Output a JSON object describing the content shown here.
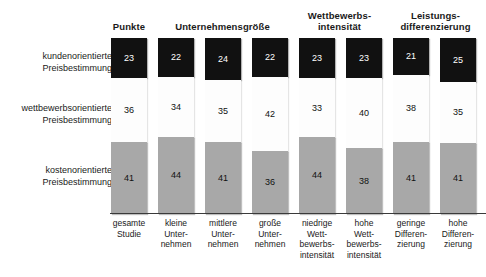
{
  "chart_data": {
    "type": "bar",
    "title": "",
    "subtitle": "",
    "xlabel": "",
    "ylabel": "",
    "stacked": true,
    "orientation": "vertical",
    "grid": false,
    "legend_position": "left-row-labels",
    "axis_baseline_visible": true,
    "ylim": [
      0,
      100
    ],
    "group_headers": [
      {
        "label": "Punkte",
        "spans": [
          0
        ]
      },
      {
        "label": "Unternehmensgröße",
        "spans": [
          1,
          2,
          3
        ]
      },
      {
        "label": "Wettbewerbs-\nintensität",
        "line1": "Wettbewerbs-",
        "line2": "intensität",
        "spans": [
          4,
          5
        ]
      },
      {
        "label": "Leistungs-\ndifferenzierung",
        "line1": "Leistungs-",
        "line2": "differenzierung",
        "spans": [
          6,
          7
        ]
      }
    ],
    "categories": [
      {
        "lines": [
          "gesamte",
          "Studie"
        ]
      },
      {
        "lines": [
          "kleine",
          "Unter-",
          "nehmen"
        ]
      },
      {
        "lines": [
          "mittlere",
          "Unter-",
          "nehmen"
        ]
      },
      {
        "lines": [
          "große",
          "Unter-",
          "nehmen"
        ]
      },
      {
        "lines": [
          "niedrige",
          "Wett-",
          "bewerbs-",
          "intensität"
        ]
      },
      {
        "lines": [
          "hohe",
          "Wett-",
          "bewerbs-",
          "intensität"
        ]
      },
      {
        "lines": [
          "geringe",
          "Differen-",
          "zierung"
        ]
      },
      {
        "lines": [
          "hohe",
          "Differen-",
          "zierung"
        ]
      }
    ],
    "series": [
      {
        "name": "kundenorientierte Preisbestimmung",
        "label_line1": "kundenorientierte",
        "label_line2": "Preisbestimmung",
        "color": "#111111",
        "value_text_color": "#ffffff",
        "values": [
          23,
          22,
          24,
          22,
          23,
          23,
          21,
          25
        ]
      },
      {
        "name": "wettbewerbsorientierte Preisbestimmung",
        "label_line1": "wettbewerbsorientierte",
        "label_line2": "Preisbestimmung",
        "color": "#fdfdfd",
        "value_text_color": "#111111",
        "values": [
          36,
          34,
          35,
          42,
          33,
          40,
          38,
          35
        ]
      },
      {
        "name": "kostenorientierte Preisbestimmung",
        "label_line1": "kostenorientierte",
        "label_line2": "Preisbestimmung",
        "color": "#a8a8a8",
        "value_text_color": "#111111",
        "values": [
          41,
          44,
          41,
          36,
          44,
          38,
          41,
          41
        ]
      }
    ]
  }
}
